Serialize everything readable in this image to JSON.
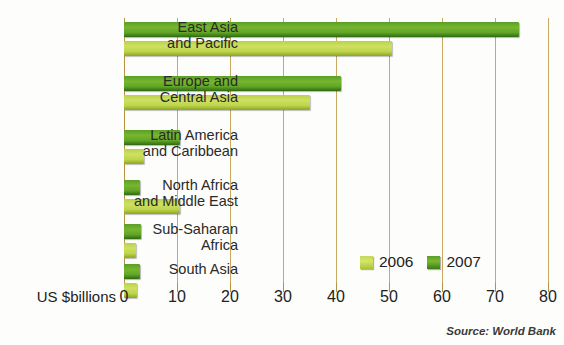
{
  "title_remnant": "",
  "axis_title": "US $billions",
  "source_note": "Source: World Bank",
  "legend": {
    "items": [
      {
        "label": "2006",
        "color": "#c3d855",
        "key": "y2006"
      },
      {
        "label": "2007",
        "color": "#5a9e27",
        "key": "y2007"
      }
    ]
  },
  "colors": {
    "bar_2006": "#c3d855",
    "bar_2007": "#5a9e27",
    "gridline": "#c9a961",
    "text": "#2a2a28",
    "background": "#fdfdfb"
  },
  "ticks": [
    {
      "label": "0",
      "value": 0
    },
    {
      "label": "10",
      "value": 10
    },
    {
      "label": "20",
      "value": 20
    },
    {
      "label": "30",
      "value": 30
    },
    {
      "label": "40",
      "value": 40
    },
    {
      "label": "50",
      "value": 50
    },
    {
      "label": "60",
      "value": 60
    },
    {
      "label": "70",
      "value": 70
    },
    {
      "label": "80",
      "value": 80
    }
  ],
  "chart_data": {
    "type": "bar",
    "orientation": "horizontal",
    "title": "",
    "xlabel": "US $billions",
    "ylabel": "",
    "xlim": [
      0,
      80
    ],
    "grid": true,
    "legend_position": "inside-bottom-right",
    "source": "Source: World Bank",
    "categories": [
      "East Asia\nand Pacific",
      "Europe and\nCentral Asia",
      "Latin America\nand Caribbean",
      "North Africa\nand Middle East",
      "Sub-Saharan\nAfrica",
      "South Asia"
    ],
    "series": [
      {
        "name": "2007",
        "color": "#5a9e27",
        "values": [
          74.5,
          41.0,
          10.5,
          3.0,
          3.2,
          3.0
        ]
      },
      {
        "name": "2006",
        "color": "#c3d855",
        "values": [
          50.5,
          35.0,
          3.7,
          10.5,
          2.3,
          2.5
        ]
      }
    ]
  }
}
